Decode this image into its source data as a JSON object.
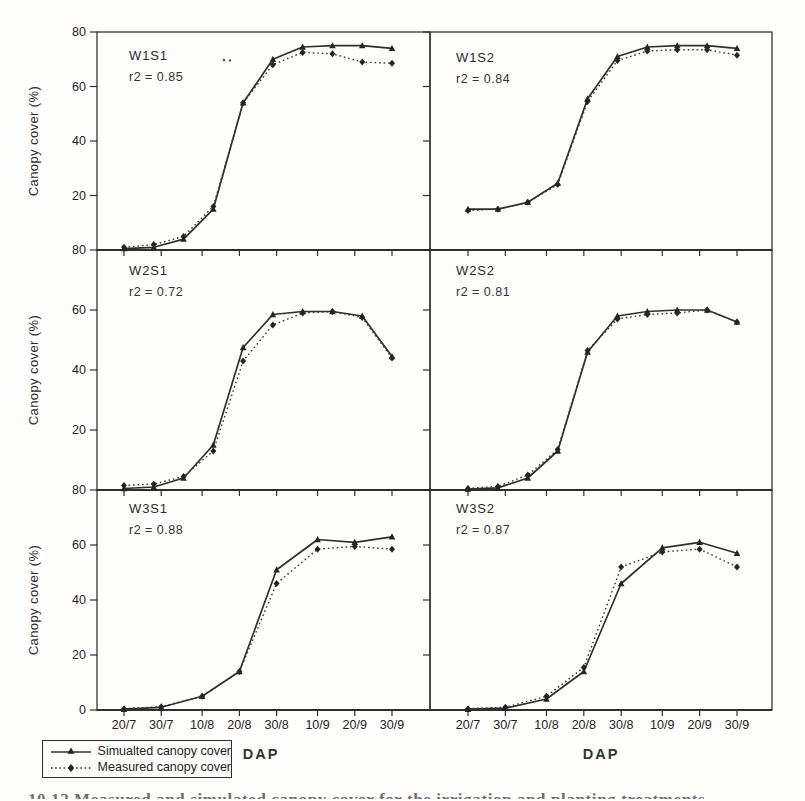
{
  "figure": {
    "y_axis_label": "Canopy cover (%)",
    "x_axis_label": "DAP",
    "x_tick_labels": [
      "20/7",
      "30/7",
      "10/8",
      "20/8",
      "30/8",
      "10/9",
      "20/9",
      "30/9"
    ],
    "y_tick_labels_by_row": [
      [
        "80",
        "60",
        "40",
        "20"
      ],
      [
        "80",
        "60",
        "40",
        "20"
      ],
      [
        "80",
        "60",
        "40",
        "20",
        "0"
      ]
    ],
    "legend": {
      "series": [
        {
          "label": "Simualted canopy cover",
          "style": "solid-line-triangle-marker"
        },
        {
          "label": "Measured canopy cover",
          "style": "dotted-line-diamond-marker"
        }
      ]
    },
    "caption_cropped": "10.12 Measured and simulated canopy cover for the irrigation and planting treatments",
    "colors": {
      "ink": "#2e2e2e",
      "background": "#fffefd"
    }
  },
  "chart_data": [
    {
      "type": "line",
      "panel": "W1S1",
      "r2_text": "r2 = 0.85",
      "row": 0,
      "col": 0,
      "ylim": [
        0,
        80
      ],
      "x_tick_days": [
        0,
        10,
        21,
        31,
        41,
        52,
        62,
        72
      ],
      "x_days": [
        0,
        8,
        16,
        24,
        32,
        40,
        48,
        56,
        64,
        72
      ],
      "series": [
        {
          "name": "Simualted canopy cover",
          "values": [
            0.5,
            1,
            4,
            15,
            54,
            70,
            74.5,
            75,
            75,
            74
          ]
        },
        {
          "name": "Measured canopy cover",
          "values": [
            1,
            2,
            5,
            16,
            54,
            68,
            72.5,
            72,
            69,
            68.5
          ]
        }
      ]
    },
    {
      "type": "line",
      "panel": "W1S2",
      "r2_text": "r2 = 0.84",
      "row": 0,
      "col": 1,
      "ylim": [
        0,
        80
      ],
      "x_tick_days": [
        0,
        10,
        21,
        31,
        41,
        52,
        62,
        72
      ],
      "x_days": [
        0,
        8,
        16,
        24,
        32,
        40,
        48,
        56,
        64,
        72
      ],
      "series": [
        {
          "name": "Simualted canopy cover",
          "values": [
            15,
            15,
            17.5,
            24.5,
            55.5,
            71,
            74.5,
            75,
            75,
            74
          ]
        },
        {
          "name": "Measured canopy cover",
          "values": [
            14.5,
            15,
            17.5,
            24,
            54.5,
            69.5,
            73,
            73.5,
            73.5,
            71.5
          ]
        }
      ]
    },
    {
      "type": "line",
      "panel": "W2S1",
      "r2_text": "r2 = 0.72",
      "row": 1,
      "col": 0,
      "ylim": [
        0,
        80
      ],
      "x_tick_days": [
        0,
        10,
        21,
        31,
        41,
        52,
        62,
        72
      ],
      "x_days": [
        0,
        8,
        16,
        24,
        32,
        40,
        48,
        56,
        64,
        72
      ],
      "series": [
        {
          "name": "Simualted canopy cover",
          "values": [
            0.5,
            1,
            4,
            15,
            47.5,
            58.5,
            59.5,
            59.5,
            58,
            44.5
          ]
        },
        {
          "name": "Measured canopy cover",
          "values": [
            1.5,
            2,
            4.5,
            13,
            43,
            55,
            59,
            59.5,
            57.5,
            44
          ]
        }
      ]
    },
    {
      "type": "line",
      "panel": "W2S2",
      "r2_text": "r2 = 0.81",
      "row": 1,
      "col": 1,
      "ylim": [
        0,
        80
      ],
      "x_tick_days": [
        0,
        10,
        21,
        31,
        41,
        52,
        62,
        72
      ],
      "x_days": [
        0,
        8,
        16,
        24,
        32,
        40,
        48,
        56,
        64,
        72
      ],
      "series": [
        {
          "name": "Simualted canopy cover",
          "values": [
            0.3,
            0.7,
            4,
            13,
            46,
            58,
            59.5,
            60,
            60,
            56
          ]
        },
        {
          "name": "Measured canopy cover",
          "values": [
            0.5,
            1.2,
            5,
            13.5,
            46.5,
            57,
            58.5,
            59,
            60,
            56
          ]
        }
      ]
    },
    {
      "type": "line",
      "panel": "W3S1",
      "r2_text": "r2 = 0.88",
      "row": 2,
      "col": 0,
      "ylim": [
        0,
        80
      ],
      "x_tick_days": [
        0,
        10,
        21,
        31,
        41,
        52,
        62,
        72
      ],
      "x_days": [
        0,
        10,
        21,
        31,
        41,
        52,
        62,
        72
      ],
      "series": [
        {
          "name": "Simualted canopy cover",
          "values": [
            0.3,
            1,
            5,
            14,
            51,
            62,
            61,
            63
          ]
        },
        {
          "name": "Measured canopy cover",
          "values": [
            0.5,
            1.2,
            5,
            14,
            46,
            58.5,
            59.5,
            58.5
          ]
        }
      ]
    },
    {
      "type": "line",
      "panel": "W3S2",
      "r2_text": "r2 = 0.87",
      "row": 2,
      "col": 1,
      "ylim": [
        0,
        80
      ],
      "x_tick_days": [
        0,
        10,
        21,
        31,
        41,
        52,
        62,
        72
      ],
      "x_days": [
        0,
        10,
        21,
        31,
        41,
        52,
        62,
        72
      ],
      "series": [
        {
          "name": "Simualted canopy cover",
          "values": [
            0.3,
            0.7,
            4,
            14,
            46,
            59,
            61,
            57
          ]
        },
        {
          "name": "Measured canopy cover",
          "values": [
            0.5,
            1,
            5,
            15.5,
            52,
            57.5,
            58.5,
            52
          ]
        }
      ]
    }
  ]
}
